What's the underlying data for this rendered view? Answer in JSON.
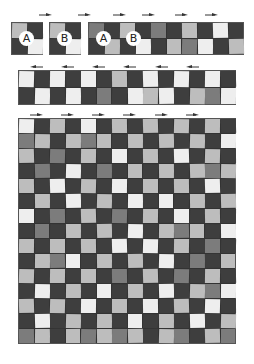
{
  "colors": {
    "W": "#eeeeee",
    "L": "#bdbdbd",
    "M": "#7c7c7c",
    "D": "#3e3e3e",
    "arrow": "#333333"
  },
  "top_row": {
    "block_a": {
      "label": "A",
      "cells": [
        [
          "L",
          "D"
        ],
        [
          "D",
          "W"
        ]
      ]
    },
    "block_b": {
      "label": "B",
      "cells": [
        [
          "L",
          "D"
        ],
        [
          "D",
          "W"
        ]
      ]
    },
    "strip": {
      "labels": [
        "A",
        "B"
      ],
      "cells": [
        [
          "M",
          "D",
          "L",
          "D",
          "M",
          "D",
          "L",
          "D",
          "W",
          "D"
        ],
        [
          "D",
          "L",
          "D",
          "W",
          "D",
          "L",
          "M",
          "W",
          "D",
          "L"
        ]
      ]
    },
    "arrows": {
      "direction": "right",
      "count": 6
    }
  },
  "middle_strip": {
    "cells": [
      [
        "W",
        "D",
        "W",
        "D",
        "W",
        "D",
        "L",
        "D",
        "W",
        "D",
        "W",
        "D",
        "W",
        "D"
      ],
      [
        "D",
        "W",
        "D",
        "W",
        "D",
        "M",
        "D",
        "W",
        "L",
        "W",
        "D",
        "L",
        "M",
        "W"
      ]
    ],
    "arrows": {
      "direction": "left",
      "count": 6
    }
  },
  "quilt": {
    "cols": 14,
    "rows": 15,
    "arrows": {
      "direction": "right",
      "count": 6
    },
    "cells": [
      [
        "W",
        "D",
        "L",
        "D",
        "W",
        "D",
        "L",
        "D",
        "L",
        "D",
        "L",
        "D",
        "L",
        "D"
      ],
      [
        "M",
        "L",
        "D",
        "L",
        "M",
        "L",
        "D",
        "L",
        "D",
        "L",
        "D",
        "L",
        "D",
        "W"
      ],
      [
        "L",
        "D",
        "M",
        "D",
        "L",
        "D",
        "W",
        "D",
        "L",
        "D",
        "W",
        "D",
        "L",
        "D"
      ],
      [
        "D",
        "M",
        "D",
        "W",
        "D",
        "M",
        "D",
        "L",
        "D",
        "L",
        "D",
        "L",
        "M",
        "L"
      ],
      [
        "L",
        "D",
        "W",
        "D",
        "L",
        "D",
        "W",
        "D",
        "L",
        "D",
        "L",
        "D",
        "W",
        "D"
      ],
      [
        "D",
        "L",
        "D",
        "W",
        "D",
        "L",
        "D",
        "W",
        "D",
        "W",
        "D",
        "L",
        "D",
        "L"
      ],
      [
        "W",
        "D",
        "M",
        "D",
        "L",
        "D",
        "M",
        "D",
        "L",
        "D",
        "W",
        "D",
        "L",
        "D"
      ],
      [
        "D",
        "M",
        "D",
        "L",
        "D",
        "L",
        "D",
        "W",
        "D",
        "L",
        "M",
        "L",
        "D",
        "W"
      ],
      [
        "L",
        "D",
        "L",
        "D",
        "L",
        "D",
        "W",
        "D",
        "W",
        "D",
        "L",
        "D",
        "M",
        "D"
      ],
      [
        "D",
        "L",
        "M",
        "W",
        "D",
        "L",
        "D",
        "L",
        "D",
        "W",
        "D",
        "M",
        "D",
        "L"
      ],
      [
        "L",
        "D",
        "L",
        "D",
        "L",
        "D",
        "M",
        "D",
        "L",
        "D",
        "M",
        "D",
        "L",
        "D"
      ],
      [
        "D",
        "W",
        "D",
        "L",
        "D",
        "W",
        "D",
        "L",
        "D",
        "W",
        "D",
        "L",
        "M",
        "W"
      ],
      [
        "L",
        "D",
        "L",
        "D",
        "W",
        "D",
        "L",
        "D",
        "W",
        "D",
        "L",
        "D",
        "W",
        "D"
      ],
      [
        "D",
        "W",
        "D",
        "L",
        "D",
        "L",
        "D",
        "W",
        "D",
        "L",
        "D",
        "W",
        "D",
        "L"
      ],
      [
        "M",
        "L",
        "D",
        "L",
        "M",
        "L",
        "M",
        "L",
        "D",
        "L",
        "M",
        "D",
        "L",
        "M"
      ]
    ]
  }
}
